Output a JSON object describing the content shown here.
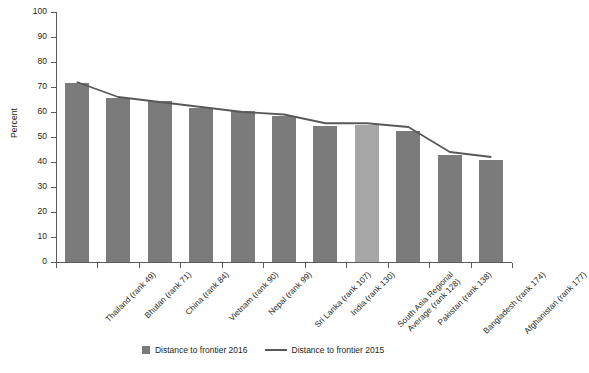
{
  "chart_data": {
    "type": "bar",
    "title": "",
    "xlabel": "",
    "ylabel": "Percent",
    "ylim": [
      0,
      100
    ],
    "yticks": [
      0,
      10,
      20,
      30,
      40,
      50,
      60,
      70,
      80,
      90,
      100
    ],
    "grid": false,
    "legend_position": "bottom",
    "categories": [
      "Thailand (rank 49)",
      "Bhutan (rank 71)",
      "China (rank 84)",
      "Vietnam (rank 90)",
      "Nepal (rank 99)",
      "Sri Lanka (rank 107)",
      "India (rank 130)",
      "South Asia Regional\nAverage (rank 128)",
      "Pakistan (rank 138)",
      "Bangladesh (rank 174)",
      "Afghanistan (rank 177)"
    ],
    "series": [
      {
        "name": "Distance to frontier 2016",
        "type": "bar",
        "color": "#7b7b7b",
        "highlight_index": 7,
        "highlight_color": "#a6a6a6",
        "values": [
          71.5,
          65.5,
          64.5,
          61.5,
          60.5,
          58.5,
          54.5,
          55.0,
          52.5,
          43.0,
          41.0
        ]
      },
      {
        "name": "Distance to frontier 2015",
        "type": "line",
        "color": "#58595b",
        "values": [
          72.0,
          66.0,
          64.0,
          62.0,
          60.0,
          59.0,
          55.5,
          55.5,
          54.0,
          44.0,
          42.0
        ]
      }
    ]
  },
  "legend": {
    "entries": [
      {
        "label": "Distance to frontier 2016",
        "marker": "square-swatch"
      },
      {
        "label": "Distance to frontier 2015",
        "marker": "line-swatch"
      }
    ]
  },
  "axis": {
    "y_title": "Percent"
  }
}
